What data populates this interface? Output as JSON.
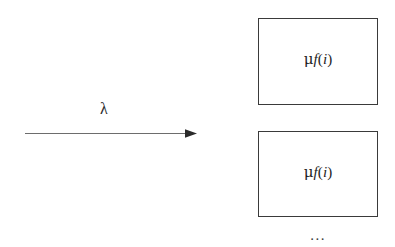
{
  "diagram": {
    "type": "queueing-network",
    "background_color": "#ffffff",
    "line_color": "#3a3a3a",
    "text_color": "#1e1e1e",
    "arrow": {
      "label": "λ",
      "label_meaning": "lambda-arrival-rate",
      "direction": "right",
      "start_x": 25,
      "end_x": 197,
      "y": 133
    },
    "servers": [
      {
        "id": "server-1",
        "label_mu": "μ",
        "label_function": "f",
        "label_open_paren": "(",
        "label_arg": "i",
        "label_close_paren": ")",
        "label_plain": "μf(i)",
        "x": 258,
        "y": 18,
        "width": 120,
        "height": 87
      },
      {
        "id": "server-2",
        "label_mu": "μ",
        "label_function": "f",
        "label_open_paren": "(",
        "label_arg": "i",
        "label_close_paren": ")",
        "label_plain": "μf(i)",
        "x": 258,
        "y": 131,
        "width": 120,
        "height": 86
      }
    ],
    "continuation": {
      "label": "…",
      "label_plain": "..."
    }
  }
}
